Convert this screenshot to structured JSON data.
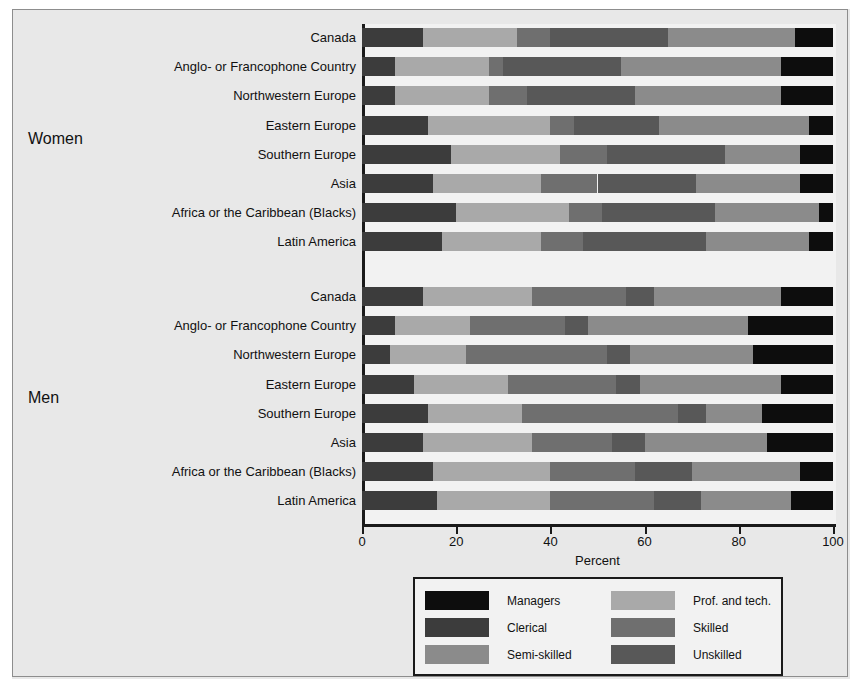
{
  "chart_data": {
    "type": "bar",
    "subtype": "stacked-horizontal",
    "title": "",
    "xlabel": "Percent",
    "ylabel": "",
    "xlim": [
      0,
      100
    ],
    "xticks": [
      0,
      20,
      40,
      60,
      80,
      100
    ],
    "xtick_labels": [
      "0",
      "20",
      "40",
      "60",
      "80",
      "100"
    ],
    "grid": true,
    "legend_position": "bottom-center",
    "series": [
      {
        "name": "Clerical",
        "color": "#3c3c3c"
      },
      {
        "name": "Prof. and tech.",
        "color": "#a9a9a9"
      },
      {
        "name": "Skilled",
        "color": "#6f6f6f"
      },
      {
        "name": "Unskilled",
        "color": "#585858"
      },
      {
        "name": "Semi-skilled",
        "color": "#8b8b8b"
      },
      {
        "name": "Managers",
        "color": "#0d0d0d"
      }
    ],
    "groups": [
      {
        "label": "Women",
        "categories": [
          "Canada",
          "Anglo- or Francophone Country",
          "Northwestern Europe",
          "Eastern Europe",
          "Southern Europe",
          "Asia",
          "Africa or the Caribbean (Blacks)",
          "Latin America"
        ],
        "rows": [
          {
            "category": "Canada",
            "segments": [
              13,
              20,
              7,
              25,
              27,
              8
            ]
          },
          {
            "category": "Anglo- or Francophone Country",
            "segments": [
              7,
              20,
              3,
              25,
              34,
              11
            ]
          },
          {
            "category": "Northwestern Europe",
            "segments": [
              7,
              20,
              8,
              23,
              31,
              11
            ]
          },
          {
            "category": "Eastern Europe",
            "segments": [
              14,
              26,
              5,
              18,
              32,
              5
            ]
          },
          {
            "category": "Southern Europe",
            "segments": [
              19,
              23,
              10,
              25,
              16,
              7
            ]
          },
          {
            "category": "Asia",
            "segments": [
              15,
              23,
              12,
              21,
              22,
              7
            ]
          },
          {
            "category": "Africa or the Caribbean (Blacks)",
            "segments": [
              20,
              24,
              7,
              24,
              22,
              3
            ]
          },
          {
            "category": "Latin America",
            "segments": [
              17,
              21,
              9,
              26,
              22,
              5
            ]
          }
        ]
      },
      {
        "label": "Men",
        "categories": [
          "Canada",
          "Anglo- or Francophone Country",
          "Northwestern Europe",
          "Eastern Europe",
          "Southern Europe",
          "Asia",
          "Africa or the Caribbean (Blacks)",
          "Latin America"
        ],
        "rows": [
          {
            "category": "Canada",
            "segments": [
              13,
              23,
              20,
              6,
              27,
              11
            ]
          },
          {
            "category": "Anglo- or Francophone Country",
            "segments": [
              7,
              16,
              20,
              5,
              34,
              18
            ]
          },
          {
            "category": "Northwestern Europe",
            "segments": [
              6,
              16,
              30,
              5,
              26,
              17
            ]
          },
          {
            "category": "Eastern Europe",
            "segments": [
              11,
              20,
              23,
              5,
              30,
              11
            ]
          },
          {
            "category": "Southern Europe",
            "segments": [
              14,
              20,
              33,
              6,
              12,
              15
            ]
          },
          {
            "category": "Asia",
            "segments": [
              13,
              23,
              17,
              7,
              26,
              14
            ]
          },
          {
            "category": "Africa or the Caribbean (Blacks)",
            "segments": [
              15,
              25,
              18,
              12,
              23,
              7
            ]
          },
          {
            "category": "Latin America",
            "segments": [
              16,
              24,
              22,
              10,
              19,
              9
            ]
          }
        ]
      }
    ],
    "segment_order": [
      "Clerical",
      "Prof. and tech.",
      "Skilled",
      "Unskilled",
      "Semi-skilled",
      "Managers"
    ]
  },
  "legend": {
    "column_left": [
      {
        "label": "Managers",
        "color": "#0d0d0d"
      },
      {
        "label": "Clerical",
        "color": "#3c3c3c"
      },
      {
        "label": "Semi-skilled",
        "color": "#8b8b8b"
      }
    ],
    "column_right": [
      {
        "label": "Prof. and tech.",
        "color": "#a9a9a9"
      },
      {
        "label": "Skilled",
        "color": "#6f6f6f"
      },
      {
        "label": "Unskilled",
        "color": "#585858"
      }
    ]
  }
}
